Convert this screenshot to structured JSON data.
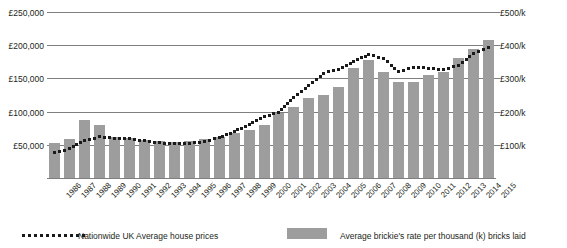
{
  "chart_data": {
    "type": "bar",
    "title": "",
    "xlabel": "",
    "ylabel": "",
    "grid": true,
    "legend_position": "bottom",
    "categories": [
      "1986",
      "1987",
      "1988",
      "1989",
      "1990",
      "1991",
      "1992",
      "1993",
      "1994",
      "1995",
      "1996",
      "1997",
      "1998",
      "1999",
      "2000",
      "2001",
      "2002",
      "2003",
      "2004",
      "2005",
      "2006",
      "2007",
      "2008",
      "2009",
      "2010",
      "2011",
      "2012",
      "2013",
      "2014",
      "2015"
    ],
    "left_axis": {
      "label_prefix": "£",
      "ticks": [
        "£50,000",
        "£100,000",
        "£150,000",
        "£200,000",
        "£250,000"
      ],
      "tick_values": [
        50000,
        100000,
        150000,
        200000,
        250000
      ],
      "ylim": [
        0,
        250000
      ]
    },
    "right_axis": {
      "ticks": [
        "£100/k",
        "£200/k",
        "£300/k",
        "£400/k",
        "£500/k"
      ],
      "tick_values": [
        100,
        200,
        300,
        400,
        500
      ],
      "ylim": [
        0,
        500
      ]
    },
    "series": [
      {
        "name": "Average brickie's rate per thousand (k) bricks laid",
        "axis": "right",
        "type": "bar",
        "color": "#9d9d9d",
        "values": [
          105,
          118,
          175,
          160,
          125,
          120,
          115,
          110,
          108,
          112,
          118,
          125,
          135,
          145,
          160,
          195,
          215,
          240,
          250,
          275,
          330,
          355,
          320,
          290,
          290,
          310,
          320,
          360,
          390,
          415
        ]
      },
      {
        "name": "Nationwide UK Average house prices",
        "axis": "left",
        "type": "line-dotted",
        "color": "#1a1a1a",
        "values": [
          38000,
          44000,
          56000,
          62000,
          60000,
          59000,
          56000,
          53000,
          52000,
          52000,
          55000,
          61000,
          70000,
          80000,
          92000,
          99000,
          121000,
          140000,
          158000,
          164000,
          176000,
          186000,
          180000,
          160000,
          167000,
          165000,
          163000,
          170000,
          188000,
          196000
        ]
      }
    ]
  },
  "legend": {
    "house_prices_label": "Nationwide UK Average house prices",
    "brickie_rate_label": "Average brickie's rate per thousand (k) bricks laid"
  }
}
